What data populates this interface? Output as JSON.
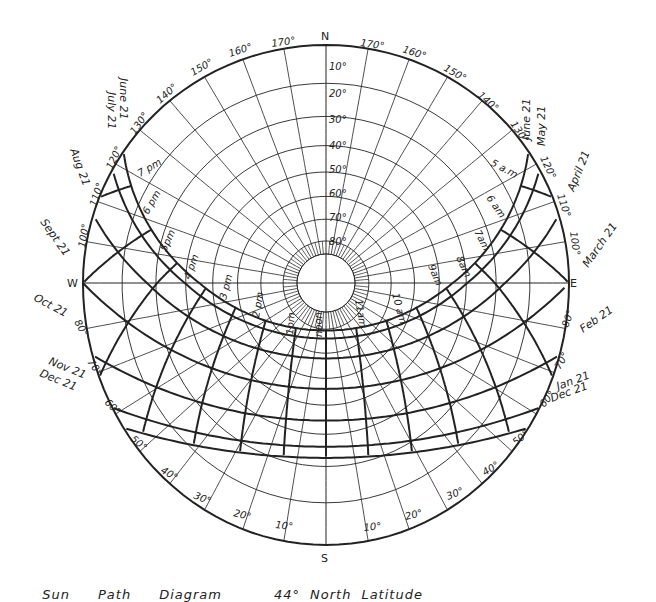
{
  "latitude_label": "44° North Latitude",
  "caption_words": [
    "Sun",
    "Path",
    "Diagram",
    "44°",
    "North",
    "Latitude"
  ],
  "compass": {
    "north": "N",
    "south": "S",
    "east": "E",
    "west": "W"
  },
  "altitude_labels": [
    "10°",
    "20°",
    "30°",
    "40°",
    "50°",
    "60°",
    "70°",
    "80°"
  ],
  "azimuth_labels_north": [
    "170°",
    "160°",
    "150°",
    "140°",
    "130°",
    "120°",
    "110°",
    "100°"
  ],
  "azimuth_labels_south": [
    "80°",
    "70°",
    "60°",
    "50°",
    "40°",
    "30°",
    "20°",
    "10°"
  ],
  "date_labels": {
    "west": [
      "June 21",
      "July 21",
      "Aug 21",
      "Sept 21",
      "Oct 21",
      "Nov 21",
      "Dec 21"
    ],
    "east": [
      "June 21",
      "May 21",
      "April 21",
      "March 21",
      "Feb 21",
      "Jan 21",
      "Dec 21"
    ]
  },
  "hour_labels": {
    "pm": [
      "7 pm",
      "6 pm",
      "5pm",
      "4 pm",
      "3 pm",
      "2 pm",
      "1pm"
    ],
    "noon": "noon",
    "am": [
      "11am",
      "10 am",
      "9am",
      "8am",
      "7am",
      "6 am",
      "5 a.m"
    ]
  },
  "colors": {
    "line": "#222222",
    "background": "#ffffff"
  },
  "chart_data": {
    "type": "diagram",
    "projection": "stereographic sky dome, north at top",
    "altitude_rings_deg": [
      10,
      20,
      30,
      40,
      50,
      60,
      70,
      80
    ],
    "azimuth_spokes_deg": [
      10,
      20,
      30,
      40,
      50,
      60,
      70,
      80,
      90,
      100,
      110,
      120,
      130,
      140,
      150,
      160,
      170
    ],
    "date_curves": [
      "June 21",
      "May 21 / July 21",
      "April 21 / Aug 21",
      "March 21 / Sept 21",
      "Feb 21 / Oct 21",
      "Jan 21 / Nov 21",
      "Dec 21"
    ],
    "hour_lines": [
      "5am",
      "6am",
      "7am",
      "8am",
      "9am",
      "10am",
      "11am",
      "noon",
      "1pm",
      "2pm",
      "3pm",
      "4pm",
      "5pm",
      "6pm",
      "7pm"
    ]
  }
}
